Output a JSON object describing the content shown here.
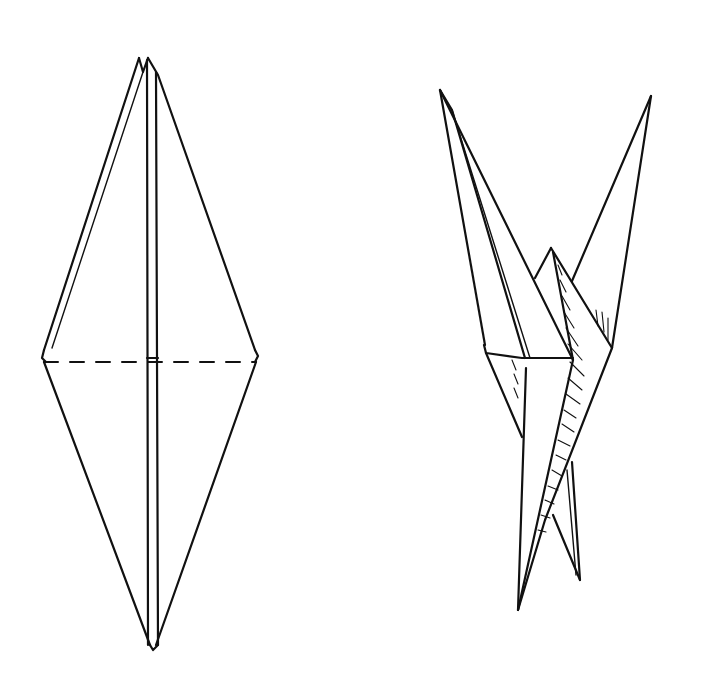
{
  "diagram": {
    "background": "#ffffff",
    "ink": "#111111",
    "figures": [
      {
        "name": "folded-diamond-base",
        "description": "Diamond-shaped folded base with valley-fold dashed line across middle",
        "outline": [
          [
            148,
            58
          ],
          [
            256,
            354
          ],
          [
            155,
            648
          ],
          [
            43,
            358
          ]
        ],
        "center_strip": [
          [
            145,
            60
          ],
          [
            155,
            60
          ],
          [
            158,
            645
          ],
          [
            150,
            645
          ]
        ],
        "left_layer": [
          [
            138,
            60
          ],
          [
            48,
            352
          ]
        ],
        "fold_line_dashed": [
          [
            43,
            362
          ],
          [
            256,
            362
          ]
        ]
      },
      {
        "name": "folded-crane-side-view",
        "description": "Partially folded crane showing neck and tail points with shaded inner layers"
      }
    ]
  }
}
